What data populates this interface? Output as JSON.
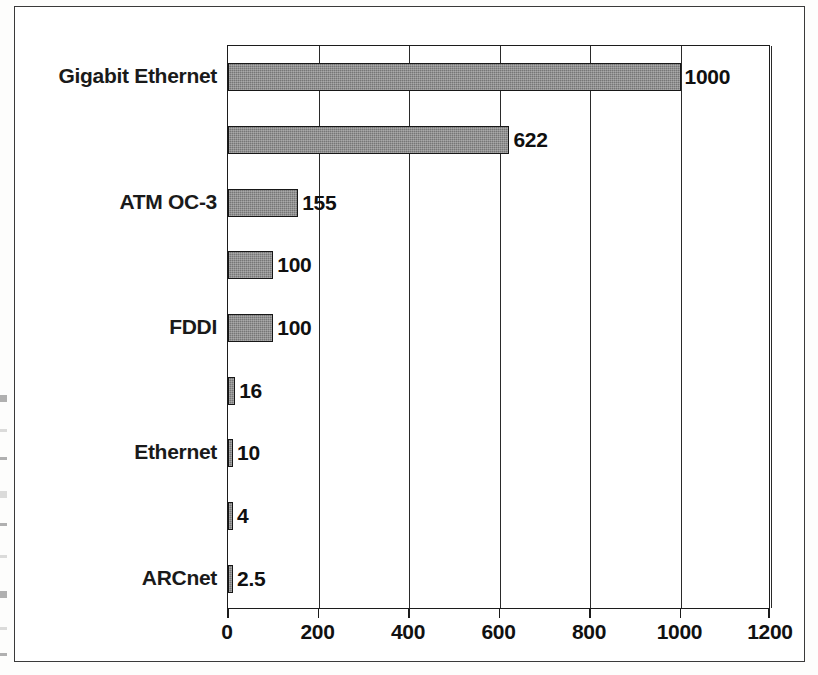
{
  "figure": {
    "frame_color": "#3a3a3a",
    "background": "#ffffff"
  },
  "chart_data": {
    "type": "bar",
    "orientation": "horizontal",
    "title": "",
    "subtitle": "",
    "xlabel": "",
    "ylabel": "",
    "xlim": [
      0,
      1200
    ],
    "ylim": null,
    "grid": true,
    "grid_axis": "x",
    "legend": null,
    "legend_position": "none",
    "bar_color": "#767676",
    "bar_edge_color": "#171717",
    "xticks": [
      0,
      200,
      400,
      600,
      800,
      1000,
      1200
    ],
    "xtick_labels": [
      "0",
      "200",
      "400",
      "600",
      "800",
      "1000",
      "1200"
    ],
    "categories": [
      "Gigabit Ethernet",
      "",
      "ATM OC-3",
      "",
      "FDDI",
      "",
      "Ethernet",
      "",
      "ARCnet"
    ],
    "values": [
      1000,
      622,
      155,
      100,
      100,
      16,
      10,
      4,
      2.5
    ],
    "data_labels": [
      "1000",
      "622",
      "155",
      "100",
      "100",
      "16",
      "10",
      "4",
      "2.5"
    ],
    "bars": [
      {
        "category": "Gigabit Ethernet",
        "value": 1000,
        "label": "1000",
        "show_category": true
      },
      {
        "category": "",
        "value": 622,
        "label": "622",
        "show_category": false
      },
      {
        "category": "ATM OC-3",
        "value": 155,
        "label": "155",
        "show_category": true
      },
      {
        "category": "",
        "value": 100,
        "label": "100",
        "show_category": false
      },
      {
        "category": "FDDI",
        "value": 100,
        "label": "100",
        "show_category": true
      },
      {
        "category": "",
        "value": 16,
        "label": "16",
        "show_category": false
      },
      {
        "category": "Ethernet",
        "value": 10,
        "label": "10",
        "show_category": true
      },
      {
        "category": "",
        "value": 4,
        "label": "4",
        "show_category": false
      },
      {
        "category": "ARCnet",
        "value": 2.5,
        "label": "2.5",
        "show_category": true
      }
    ]
  },
  "axis": {
    "tick_0": "0",
    "tick_200": "200",
    "tick_400": "400",
    "tick_600": "600",
    "tick_800": "800",
    "tick_1000": "1000",
    "tick_1200": "1200"
  },
  "labels": {
    "gigabit_ethernet": "Gigabit Ethernet",
    "atm_oc3": "ATM OC-3",
    "fddi": "FDDI",
    "ethernet": "Ethernet",
    "arcnet": "ARCnet"
  },
  "values": {
    "v1000": "1000",
    "v622": "622",
    "v155": "155",
    "v100a": "100",
    "v100b": "100",
    "v16": "16",
    "v10": "10",
    "v4": "4",
    "v2_5": "2.5"
  }
}
